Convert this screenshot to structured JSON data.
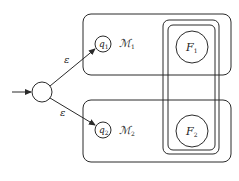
{
  "diagram": {
    "type": "nfa-union-construction",
    "start_state": {
      "label": ""
    },
    "transitions": [
      {
        "from": "start",
        "to": "q1",
        "label": "ε"
      },
      {
        "from": "start",
        "to": "q2",
        "label": "ε"
      }
    ],
    "machines": [
      {
        "name": "ℳ",
        "subscript": "1",
        "start": "q",
        "start_sub": "1",
        "final": "F",
        "final_sub": "1"
      },
      {
        "name": "ℳ",
        "subscript": "2",
        "start": "q",
        "start_sub": "2",
        "final": "F",
        "final_sub": "2"
      }
    ],
    "colors": {
      "stroke": "#2a2a2a",
      "background": "#ffffff"
    }
  }
}
